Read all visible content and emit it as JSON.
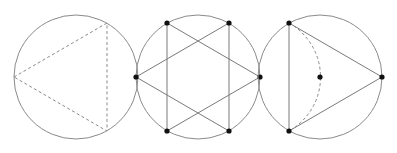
{
  "figure": {
    "colors": {
      "circle": "#8a8a8a",
      "line": "#7a7a7a",
      "dot": "#111111",
      "background": "#ffffff"
    },
    "radius": 62,
    "panels": [
      {
        "id": "left",
        "center": [
          76,
          77
        ],
        "style": "dashed triangle inscribed, vertex pointing left",
        "triangle": [
          [
            14,
            77
          ],
          [
            107,
            23
          ],
          [
            107,
            131
          ]
        ]
      },
      {
        "id": "middle",
        "center": [
          198,
          77
        ],
        "style": "hexagram (two overlapping triangles) with six vertex dots and vertical chords",
        "points": [
          [
            136,
            77
          ],
          [
            167,
            23
          ],
          [
            229,
            23
          ],
          [
            260,
            77
          ],
          [
            229,
            131
          ],
          [
            167,
            131
          ]
        ]
      },
      {
        "id": "right",
        "center": [
          320,
          77
        ],
        "style": "solid triangle pointing right with dashed arc and center dot",
        "triangle": [
          [
            289,
            23
          ],
          [
            382,
            77
          ],
          [
            289,
            131
          ]
        ]
      }
    ]
  }
}
